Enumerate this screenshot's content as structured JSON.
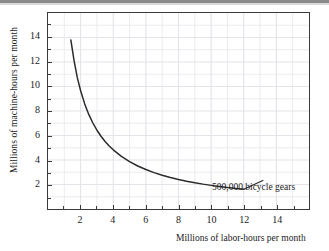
{
  "chart_data": {
    "type": "line",
    "title": "",
    "subtitle": "",
    "xlabel": "Millions of labor-hours per month",
    "ylabel": "Millions of machine-hours per month",
    "xlim": [
      0,
      16
    ],
    "ylim": [
      0,
      16
    ],
    "grid": true,
    "legend_position": "none",
    "xticks": [
      2,
      4,
      6,
      8,
      10,
      12,
      14
    ],
    "yticks": [
      2,
      4,
      6,
      8,
      10,
      12,
      14
    ],
    "xtick_labels": [
      "2",
      "4",
      "6",
      "8",
      "10",
      "12",
      "14"
    ],
    "ytick_labels": [
      "2",
      "4",
      "6",
      "8",
      "10",
      "12",
      "14"
    ],
    "minor_tick_step": 1,
    "series": [
      {
        "name": "500,000 bicycle gears",
        "kind": "isoquant",
        "relation": "x * y = 19.3",
        "color": "#2b2b2b",
        "x": [
          1.4,
          1.6,
          1.8,
          2.0,
          2.25,
          2.5,
          2.75,
          3.0,
          3.25,
          3.5,
          3.75,
          4.0,
          4.5,
          5.0,
          5.5,
          6.0,
          6.5,
          7.0,
          7.5,
          8.0,
          8.5,
          9.0,
          9.5,
          10.0,
          10.5,
          11.0,
          11.5,
          12.0
        ],
        "y": [
          13.8,
          12.1,
          10.7,
          9.65,
          8.58,
          7.72,
          7.02,
          6.43,
          5.94,
          5.51,
          5.15,
          4.83,
          4.29,
          3.86,
          3.51,
          3.22,
          2.97,
          2.76,
          2.57,
          2.41,
          2.27,
          2.15,
          2.03,
          1.93,
          1.84,
          1.75,
          1.68,
          1.61
        ]
      }
    ],
    "annotations": [
      {
        "text": "500,000 bicycle gears",
        "anchor_x": 12.0,
        "anchor_y": 1.61,
        "leader_to_x": 13.2,
        "leader_to_y": 2.35
      }
    ]
  },
  "axes": {
    "x_title": "Millions of labor-hours per month",
    "y_title": "Millions of machine-hours per month"
  },
  "annotation_label": "500,000 bicycle gears",
  "colors": {
    "curve": "#2b2b2b",
    "frame": "#3a3a3a",
    "grid": "#e3e3e9",
    "text": "#1b1b1b",
    "background": "#ffffff"
  }
}
